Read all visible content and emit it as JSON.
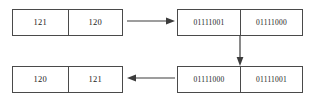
{
  "diagram": {
    "type": "byte-swap-illustration",
    "background_color": "#ffffff",
    "line_color": "#4a4a4a",
    "text_color": "#1a1a1a",
    "boxes": [
      {
        "id": "top-left",
        "kind": "decimal",
        "cells": [
          {
            "label": "121"
          },
          {
            "label": "120"
          }
        ]
      },
      {
        "id": "top-right",
        "kind": "binary",
        "cells": [
          {
            "label": "01111001"
          },
          {
            "label": "01111000"
          }
        ]
      },
      {
        "id": "bottom-left",
        "kind": "decimal",
        "cells": [
          {
            "label": "120"
          },
          {
            "label": "121"
          }
        ]
      },
      {
        "id": "bottom-right",
        "kind": "binary",
        "cells": [
          {
            "label": "01111000"
          },
          {
            "label": "01111001"
          }
        ]
      }
    ],
    "arrows": [
      {
        "id": "top",
        "direction": "right",
        "icon": "arrow-right-icon"
      },
      {
        "id": "right",
        "direction": "down",
        "icon": "arrow-down-icon"
      },
      {
        "id": "bottom",
        "direction": "left",
        "icon": "arrow-left-icon"
      }
    ]
  }
}
